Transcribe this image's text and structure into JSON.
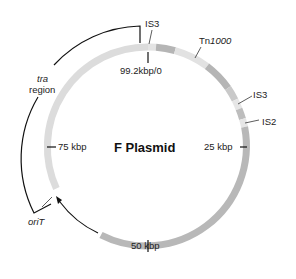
{
  "title": "F Plasmid",
  "total_size": "99.2 kbp",
  "colors": {
    "ring_light": "#d9d9d9",
    "ring_dark": "#b3b3b3",
    "ring_pale": "#e6e6e6",
    "line": "#111111"
  },
  "ticks": [
    {
      "label": "99.2kbp/0",
      "position_kbp": 0
    },
    {
      "label": "25 kbp",
      "position_kbp": 25
    },
    {
      "label": "50 kbp",
      "position_kbp": 50
    },
    {
      "label": "75 kbp",
      "position_kbp": 75
    }
  ],
  "features": [
    {
      "label": "IS3",
      "italic_part": "",
      "type": "insertion-sequence"
    },
    {
      "label": "Tn",
      "italic_part": "1000",
      "type": "transposon"
    },
    {
      "label": "IS3",
      "italic_part": "",
      "type": "insertion-sequence"
    },
    {
      "label": "IS2",
      "italic_part": "",
      "type": "insertion-sequence"
    },
    {
      "label": "oriT",
      "italic_part": "oriT",
      "type": "origin-of-transfer"
    }
  ],
  "regions": [
    {
      "label_line1": "tra",
      "label_line2": "region",
      "type": "transfer-region"
    }
  ]
}
